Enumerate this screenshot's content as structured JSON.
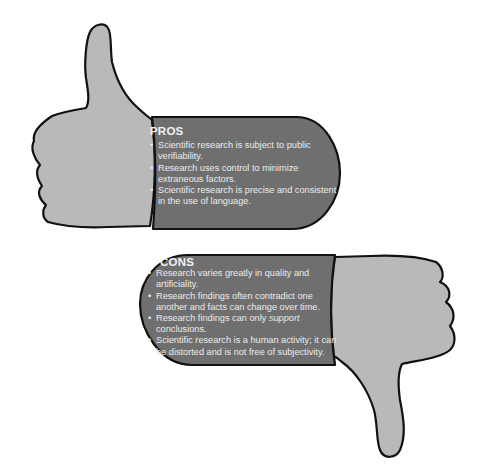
{
  "pros": {
    "title": "PROS",
    "items": [
      "Scientific research is subject to public verifiability.",
      "Research uses control to minimize extraneous factors.",
      "Scientific research is precise and consistent in the use of language."
    ]
  },
  "cons": {
    "title": "CONS",
    "items": [
      "Research varies greatly in quality and artificiality.",
      "Research findings often contradict one another and facts can change over time.",
      "Research findings can only support conclusions.",
      "Scientific research is a human activity; it can be distorted and is not free of subjectivity."
    ],
    "emphasis_word": "support"
  },
  "icons": [
    "thumbs-up-icon",
    "thumbs-down-icon"
  ],
  "colors": {
    "hand_fill": "#b9b9b9",
    "panel_fill": "#6f6f6f",
    "outline": "#111111",
    "text": "#ececec"
  }
}
